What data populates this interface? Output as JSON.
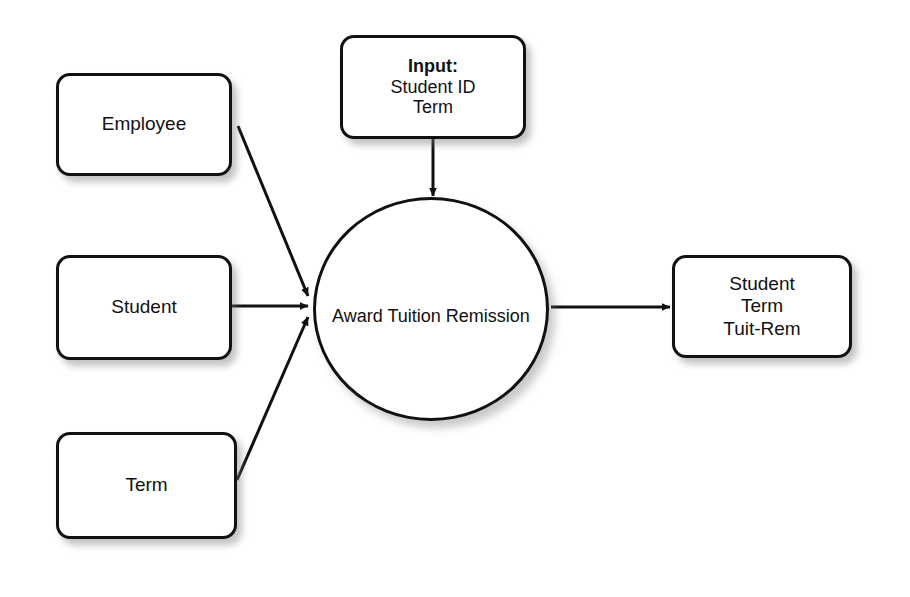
{
  "diagram": {
    "background_color": "#ffffff",
    "stroke_color": "#111111",
    "nodes": {
      "employee": {
        "label": "Employee",
        "shape": "rounded-rectangle"
      },
      "student": {
        "label": "Student",
        "shape": "rounded-rectangle"
      },
      "term": {
        "label": "Term",
        "shape": "rounded-rectangle"
      },
      "input": {
        "shape": "rounded-rectangle",
        "heading": "Input:",
        "line1": "Student ID",
        "line2": "Term"
      },
      "process": {
        "shape": "circle",
        "line1": "Award",
        "line2": "Tuition",
        "line3": "Remission"
      },
      "output": {
        "shape": "rounded-rectangle",
        "line1": "Student",
        "line2": "Term",
        "line3": "Tuit-Rem"
      }
    },
    "edges": [
      {
        "id": "employee-to-process",
        "from": "employee",
        "to": "process",
        "style": "diagonal-arrow"
      },
      {
        "id": "student-to-process",
        "from": "student",
        "to": "process",
        "style": "horizontal-arrow"
      },
      {
        "id": "term-to-process",
        "from": "term",
        "to": "process",
        "style": "diagonal-arrow"
      },
      {
        "id": "input-to-process",
        "from": "input",
        "to": "process",
        "style": "vertical-arrow"
      },
      {
        "id": "process-to-output",
        "from": "process",
        "to": "output",
        "style": "horizontal-arrow"
      }
    ]
  }
}
